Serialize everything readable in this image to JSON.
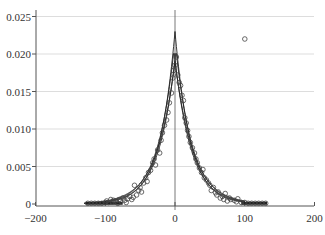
{
  "chart_data": {
    "type": "scatter",
    "title": "",
    "xlabel": "",
    "ylabel": "",
    "xlim": [
      -200,
      200
    ],
    "ylim": [
      0,
      0.025
    ],
    "grid": {
      "horizontal": true,
      "vertical": false
    },
    "x_ticks": [
      "-200",
      "-100",
      "0",
      "100",
      "200"
    ],
    "y_ticks": [
      "0",
      "0.005",
      "0.010",
      "0.015",
      "0.020",
      "0.025"
    ],
    "legend": null,
    "series": [
      {
        "name": "observations",
        "marker": "open-circle",
        "points": [
          [
            -125,
            0.0001
          ],
          [
            -120,
            0.0001
          ],
          [
            -115,
            0.0001
          ],
          [
            -110,
            0.0001
          ],
          [
            -105,
            0.0001
          ],
          [
            -100,
            0.0002
          ],
          [
            -98,
            0.0004
          ],
          [
            -95,
            0.0002
          ],
          [
            -92,
            0.0006
          ],
          [
            -90,
            0.0003
          ],
          [
            -88,
            0.0005
          ],
          [
            -85,
            0.0004
          ],
          [
            -82,
            0.0001
          ],
          [
            -80,
            0.0006
          ],
          [
            -78,
            0.0004
          ],
          [
            -75,
            0.0008
          ],
          [
            -72,
            0.0005
          ],
          [
            -70,
            0.0002
          ],
          [
            -68,
            0.0007
          ],
          [
            -65,
            0.001
          ],
          [
            -62,
            0.0006
          ],
          [
            -60,
            0.0009
          ],
          [
            -58,
            0.0025
          ],
          [
            -55,
            0.0012
          ],
          [
            -52,
            0.0018
          ],
          [
            -50,
            0.0022
          ],
          [
            -48,
            0.0016
          ],
          [
            -45,
            0.0028
          ],
          [
            -42,
            0.0035
          ],
          [
            -40,
            0.003
          ],
          [
            -38,
            0.0042
          ],
          [
            -35,
            0.0045
          ],
          [
            -32,
            0.0055
          ],
          [
            -30,
            0.006
          ],
          [
            -28,
            0.0052
          ],
          [
            -25,
            0.0072
          ],
          [
            -22,
            0.0068
          ],
          [
            -20,
            0.0085
          ],
          [
            -18,
            0.0095
          ],
          [
            -15,
            0.0105
          ],
          [
            -12,
            0.0112
          ],
          [
            -10,
            0.0122
          ],
          [
            -8,
            0.0135
          ],
          [
            -5,
            0.0148
          ],
          [
            -3,
            0.0168
          ],
          [
            -2,
            0.0178
          ],
          [
            0,
            0.0185
          ],
          [
            2,
            0.0196
          ],
          [
            4,
            0.0172
          ],
          [
            6,
            0.0162
          ],
          [
            8,
            0.0158
          ],
          [
            10,
            0.0145
          ],
          [
            12,
            0.0138
          ],
          [
            14,
            0.0115
          ],
          [
            16,
            0.0108
          ],
          [
            18,
            0.0098
          ],
          [
            20,
            0.009
          ],
          [
            22,
            0.0082
          ],
          [
            25,
            0.0075
          ],
          [
            28,
            0.0068
          ],
          [
            30,
            0.006
          ],
          [
            32,
            0.0055
          ],
          [
            35,
            0.0048
          ],
          [
            38,
            0.0042
          ],
          [
            40,
            0.0046
          ],
          [
            42,
            0.0035
          ],
          [
            45,
            0.0032
          ],
          [
            48,
            0.0028
          ],
          [
            50,
            0.0025
          ],
          [
            52,
            0.0018
          ],
          [
            55,
            0.0022
          ],
          [
            58,
            0.0015
          ],
          [
            60,
            0.0012
          ],
          [
            62,
            0.0016
          ],
          [
            65,
            0.0008
          ],
          [
            68,
            0.001
          ],
          [
            70,
            0.0006
          ],
          [
            72,
            0.0014
          ],
          [
            75,
            0.0004
          ],
          [
            78,
            0.0008
          ],
          [
            80,
            0.0006
          ],
          [
            85,
            0.0005
          ],
          [
            88,
            0.0003
          ],
          [
            90,
            0.0007
          ],
          [
            95,
            0.0002
          ],
          [
            100,
            0.0002
          ],
          [
            105,
            0.0001
          ],
          [
            110,
            0.0001
          ],
          [
            115,
            0.0001
          ],
          [
            120,
            0.0001
          ],
          [
            125,
            0.0001
          ],
          [
            130,
            0.0001
          ],
          [
            100,
            0.022
          ]
        ]
      },
      {
        "name": "fit",
        "type": "line",
        "description": "Laplace-shaped peak fit with confidence band",
        "x": [
          -130,
          -100,
          -80,
          -60,
          -40,
          -20,
          -10,
          0,
          10,
          20,
          40,
          60,
          80,
          100
        ],
        "y": [
          0.0001,
          0.0002,
          0.0005,
          0.0012,
          0.003,
          0.0075,
          0.0125,
          0.023,
          0.0125,
          0.0075,
          0.003,
          0.0012,
          0.0005,
          0.0002
        ]
      }
    ]
  },
  "axes": {
    "x_ticks": [
      {
        "label": "−200",
        "value": -200
      },
      {
        "label": "−100",
        "value": -100
      },
      {
        "label": "0",
        "value": 0
      },
      {
        "label": "100",
        "value": 100
      },
      {
        "label": "200",
        "value": 200
      }
    ],
    "y_ticks": [
      {
        "label": "0",
        "value": 0
      },
      {
        "label": "0.005",
        "value": 0.005
      },
      {
        "label": "0.010",
        "value": 0.01
      },
      {
        "label": "0.015",
        "value": 0.015
      },
      {
        "label": "0.020",
        "value": 0.02
      },
      {
        "label": "0.025",
        "value": 0.025
      }
    ]
  },
  "colors": {
    "grid": "#dddddd",
    "axis": "#555555",
    "marker": "#444444",
    "line": "#222222"
  }
}
